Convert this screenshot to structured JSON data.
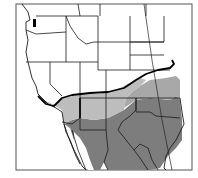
{
  "map": {
    "region": "Western United States and Mexico",
    "legend_visible": false,
    "colors": {
      "background": "#ffffff",
      "land": "#ffffff",
      "light_range": "#bdbdbd",
      "mid_range": "#a8a8a8",
      "dark_range": "#7d7d7d",
      "borders": "#1a1a1a",
      "range_boundary": "#000000"
    },
    "zones": [
      {
        "name": "northern-range",
        "shade": "light"
      },
      {
        "name": "southern-range",
        "shade": "dark"
      }
    ]
  }
}
